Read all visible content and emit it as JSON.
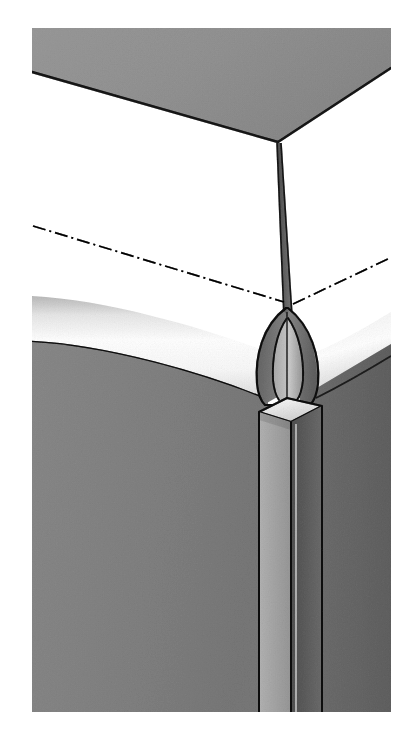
{
  "figure": {
    "caption": "",
    "type": "technical-line-drawing",
    "canvas": {
      "width": 405,
      "height": 745
    },
    "palette": {
      "background": "#ffffff",
      "top_face": "#c0c0c0",
      "front_face": "#b4b4b4",
      "right_face": "#a3a3a3",
      "bullnose_light": "#fdfdfd",
      "bullnose_shadow": "#d6d6d6",
      "post_top_face": "#f2f2f2",
      "post_left_face": "#d2d2d2",
      "post_right_face": "#9a9a9a",
      "leaf_fill": "#a8a8a8",
      "leaf_inner_fill": "#bdbdbd",
      "seam_fill": "#8f8f8f",
      "outline": "#3a3a3a",
      "centerline": "#2b2b2b",
      "dark_strip": "#7d7d7d"
    },
    "parts": [
      {
        "id": "top-panel",
        "name": "top-panel-surface",
        "shade": "medium-gray"
      },
      {
        "id": "front-panel",
        "name": "front-panel-surface",
        "shade": "medium-gray"
      },
      {
        "id": "right-panel",
        "name": "right-panel-surface",
        "shade": "darker-gray"
      },
      {
        "id": "front-bullnose",
        "name": "front-rounded-edge",
        "shade": "highlight-gradient"
      },
      {
        "id": "right-bullnose",
        "name": "right-rounded-edge",
        "shade": "highlight-gradient"
      },
      {
        "id": "corner-post",
        "name": "vertical-corner-post",
        "shade": "light-gray"
      },
      {
        "id": "leaf-outer",
        "name": "leaf-shaped-recess-outer",
        "shade": "gray"
      },
      {
        "id": "leaf-inner",
        "name": "leaf-shaped-recess-inner",
        "shade": "light-gray"
      },
      {
        "id": "seam-wedge",
        "name": "tapered-seam-wedge",
        "shade": "gray"
      },
      {
        "id": "centerline-left",
        "name": "dash-dot-centerline-left",
        "style": "dash-dot"
      },
      {
        "id": "centerline-right",
        "name": "dash-dot-centerline-right",
        "style": "dash-dot"
      }
    ],
    "geometry": {
      "top_apex": {
        "x": 278,
        "y": 142
      },
      "top_left_corner": {
        "x": 32,
        "y": 72
      },
      "top_right_corner": {
        "x": 391,
        "y": 68
      },
      "top_back_left": {
        "x": 32,
        "y": 28
      },
      "top_back_right": {
        "x": 391,
        "y": 28
      },
      "post_top_center": {
        "x": 288,
        "y": 404
      },
      "bottom_edge_y": 712,
      "left_edge_x": 32,
      "right_edge_x": 386
    }
  }
}
